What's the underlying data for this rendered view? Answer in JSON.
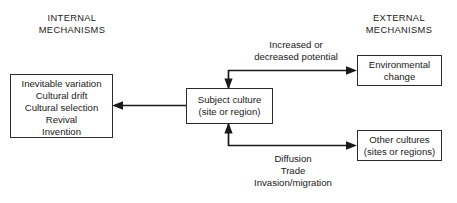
{
  "diagram": {
    "title_internal": "INTERNAL",
    "headers": [
      {
        "name": "internal-mechanisms-header",
        "line1": "INTERNAL",
        "line2": "MECHANISMS"
      },
      {
        "name": "external-mechanisms-header",
        "line1": "EXTERNAL",
        "line2": "MECHANISMS"
      }
    ],
    "boxes": {
      "internal_mechanisms": {
        "lines": [
          "Inevitable variation",
          "Cultural drift",
          "Cultural selection",
          "Revival",
          "Invention"
        ]
      },
      "subject_culture": {
        "line1": "Subject culture",
        "line2": "(site or region)"
      },
      "environmental_change": {
        "line1": "Environmental",
        "line2": "change"
      },
      "other_cultures": {
        "line1": "Other cultures",
        "line2": "(sites or regions)"
      }
    },
    "edge_labels": {
      "top": {
        "line1": "Increased or",
        "line2": "decreased potential"
      },
      "bottom": {
        "line1": "Diffusion",
        "line2": "Trade",
        "line3": "Invasion/migration"
      }
    },
    "colors": {
      "background": "#ffffff",
      "line": "#1a1a1a",
      "box_border": "#2b2b2b",
      "text": "#1a1a1a"
    }
  }
}
